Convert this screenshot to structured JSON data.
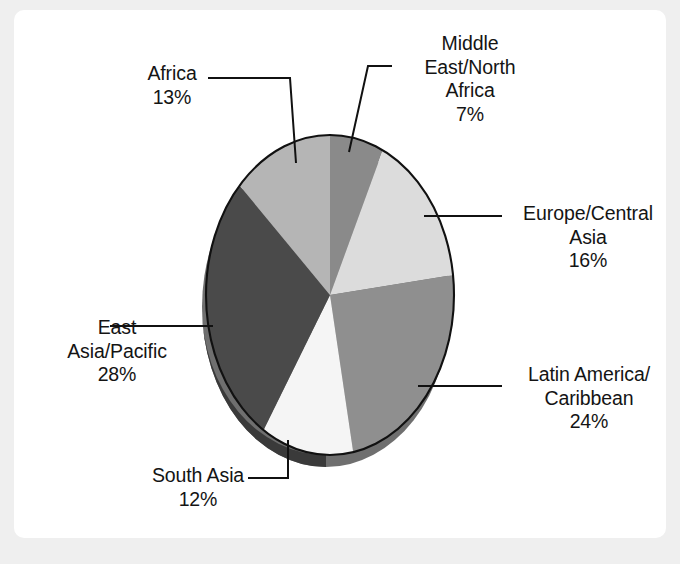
{
  "chart_data": {
    "type": "pie",
    "title": "",
    "subtitle": "",
    "xlabel": "",
    "ylabel": "",
    "legend_position": "none",
    "grid": false,
    "labels_outside": true,
    "value_suffix": "%",
    "categories": [
      "Middle East/North Africa",
      "Europe/Central Asia",
      "Latin America/Caribbean",
      "South Asia",
      "East Asia/Pacific",
      "Africa"
    ],
    "values": [
      7,
      16,
      24,
      12,
      28,
      13
    ],
    "total": 100,
    "slices": [
      {
        "name": "Middle East/North Africa",
        "label_lines": [
          "Middle",
          "East/North",
          "Africa"
        ],
        "value": 7,
        "value_text": "7%",
        "color": "#8a8a8a",
        "side_color": "#6d6d6d",
        "start_angle_deg": 0,
        "end_angle_deg": 25.2
      },
      {
        "name": "Europe/Central Asia",
        "label_lines": [
          "Europe/Central",
          "Asia"
        ],
        "value": 16,
        "value_text": "16%",
        "color": "#dcdcdc",
        "side_color": "#b0b0b0",
        "start_angle_deg": 25.2,
        "end_angle_deg": 82.8
      },
      {
        "name": "Latin America/Caribbean",
        "label_lines": [
          "Latin America/",
          "Caribbean"
        ],
        "value": 24,
        "value_text": "24%",
        "color": "#8f8f8f",
        "side_color": "#707070",
        "start_angle_deg": 82.8,
        "end_angle_deg": 169.2
      },
      {
        "name": "South Asia",
        "label_lines": [
          "South Asia"
        ],
        "value": 12,
        "value_text": "12%",
        "color": "#f5f5f5",
        "side_color": "#c4c4c4",
        "start_angle_deg": 169.2,
        "end_angle_deg": 212.4
      },
      {
        "name": "East Asia/Pacific",
        "label_lines": [
          "East",
          "Asia/Pacific"
        ],
        "value": 28,
        "value_text": "28%",
        "color": "#4a4a4a",
        "side_color": "#3a3a3a",
        "start_angle_deg": 212.4,
        "end_angle_deg": 313.2
      },
      {
        "name": "Africa",
        "label_lines": [
          "Africa"
        ],
        "value": 13,
        "value_text": "13%",
        "color": "#b5b5b5",
        "side_color": "#8f8f8f",
        "start_angle_deg": 313.2,
        "end_angle_deg": 360
      }
    ],
    "colors": [
      "#8a8a8a",
      "#dcdcdc",
      "#8f8f8f",
      "#f5f5f5",
      "#4a4a4a",
      "#b5b5b5"
    ]
  },
  "labels": {
    "mena": {
      "l1": "Middle",
      "l2": "East/North",
      "l3": "Africa",
      "pct": "7%"
    },
    "africa": {
      "l1": "Africa",
      "pct": "13%"
    },
    "eca": {
      "l1": "Europe/Central",
      "l2": "Asia",
      "pct": "16%"
    },
    "lac": {
      "l1": "Latin America/",
      "l2": "Caribbean",
      "pct": "24%"
    },
    "eap": {
      "l1": "East",
      "l2": "Asia/Pacific",
      "pct": "28%"
    },
    "sa": {
      "l1": "South Asia",
      "pct": "12%"
    }
  },
  "style": {
    "page_background": "#efefef",
    "card_background": "#ffffff",
    "text_color": "#141414",
    "outline_color": "#111111",
    "leader_color": "#111111"
  }
}
